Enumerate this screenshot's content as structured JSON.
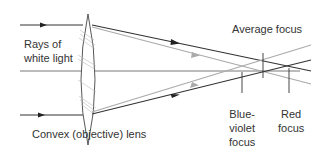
{
  "labels": {
    "rays": [
      "Rays of",
      "white light"
    ],
    "lens": "Convex (objective) lens",
    "average_focus": "Average focus",
    "blue_violet_focus": [
      "Blue-",
      "violet",
      "focus"
    ],
    "red_focus": [
      "Red",
      "focus"
    ]
  },
  "colors": {
    "dark_ray": "#333333",
    "light_ray": "#aaaaaa",
    "axis": "#555555",
    "lens_outline": "#444444",
    "lens_hatch": "#bbbbbb",
    "text": "#333333"
  },
  "elements": {
    "lens": {
      "cx": 88,
      "top": 14,
      "bottom": 145,
      "half_width": 12
    },
    "optical_axis": {
      "x1": 20,
      "x2": 300,
      "y": 71
    },
    "incoming_rays": [
      {
        "y": 25,
        "arrow_x": 45
      },
      {
        "y": 115,
        "arrow_x": 43
      }
    ],
    "focus_markers": [
      {
        "name": "average",
        "x": 263,
        "y1": 53,
        "y2": 78
      },
      {
        "name": "blue-violet",
        "x": 242,
        "y1": 72,
        "y2": 93
      },
      {
        "name": "red",
        "x": 289,
        "y1": 68,
        "y2": 93
      }
    ]
  }
}
